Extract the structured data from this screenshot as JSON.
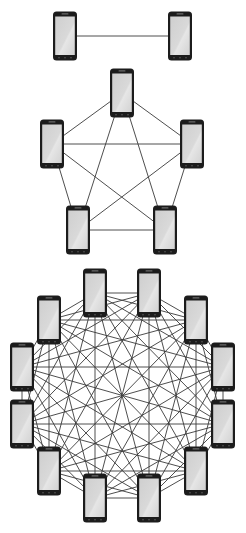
{
  "diagram": {
    "title": "",
    "colors": {
      "background": "#ffffff",
      "edge": "#3a3a3a",
      "phone_body": "#1c1c1c",
      "phone_screen": "#d4d4d4",
      "phone_screen_highlight": "#e8e8e8"
    },
    "phone_size": {
      "width": 24,
      "height": 49
    },
    "graphs": [
      {
        "name": "complete-graph-2-nodes",
        "node_count": 2,
        "complete": true,
        "nodes": [
          {
            "id": "a1",
            "icon": "smartphone-icon",
            "cx": 65,
            "cy": 36
          },
          {
            "id": "a2",
            "icon": "smartphone-icon",
            "cx": 180,
            "cy": 36
          }
        ]
      },
      {
        "name": "complete-graph-5-nodes",
        "node_count": 5,
        "complete": true,
        "nodes": [
          {
            "id": "b1",
            "icon": "smartphone-icon",
            "cx": 122,
            "cy": 93
          },
          {
            "id": "b2",
            "icon": "smartphone-icon",
            "cx": 192,
            "cy": 144
          },
          {
            "id": "b3",
            "icon": "smartphone-icon",
            "cx": 165,
            "cy": 230
          },
          {
            "id": "b4",
            "icon": "smartphone-icon",
            "cx": 78,
            "cy": 230
          },
          {
            "id": "b5",
            "icon": "smartphone-icon",
            "cx": 52,
            "cy": 144
          }
        ]
      },
      {
        "name": "complete-graph-12-nodes",
        "node_count": 12,
        "complete": true,
        "nodes": [
          {
            "id": "c1",
            "icon": "smartphone-icon",
            "cx": 95,
            "cy": 293
          },
          {
            "id": "c2",
            "icon": "smartphone-icon",
            "cx": 149,
            "cy": 293
          },
          {
            "id": "c3",
            "icon": "smartphone-icon",
            "cx": 196,
            "cy": 320
          },
          {
            "id": "c4",
            "icon": "smartphone-icon",
            "cx": 223,
            "cy": 367
          },
          {
            "id": "c5",
            "icon": "smartphone-icon",
            "cx": 223,
            "cy": 424
          },
          {
            "id": "c6",
            "icon": "smartphone-icon",
            "cx": 196,
            "cy": 471
          },
          {
            "id": "c7",
            "icon": "smartphone-icon",
            "cx": 149,
            "cy": 498
          },
          {
            "id": "c8",
            "icon": "smartphone-icon",
            "cx": 95,
            "cy": 498
          },
          {
            "id": "c9",
            "icon": "smartphone-icon",
            "cx": 49,
            "cy": 471
          },
          {
            "id": "c10",
            "icon": "smartphone-icon",
            "cx": 22,
            "cy": 424
          },
          {
            "id": "c11",
            "icon": "smartphone-icon",
            "cx": 22,
            "cy": 367
          },
          {
            "id": "c12",
            "icon": "smartphone-icon",
            "cx": 49,
            "cy": 320
          }
        ]
      }
    ]
  }
}
